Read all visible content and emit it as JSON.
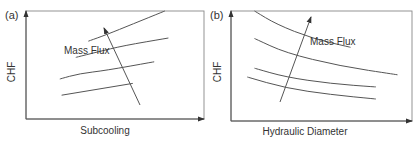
{
  "chart_data": [
    {
      "type": "line",
      "panel_label": "(a)",
      "title": "",
      "xlabel": "Subcooling",
      "ylabel": "CHF",
      "annotation": "Mass Flux",
      "annotation_meaning": "arrow indicates increasing mass flux",
      "trend": "CHF increases with subcooling; curves shift upward with increasing mass flux",
      "xlim": [
        0,
        1
      ],
      "ylim": [
        0,
        1
      ],
      "series": [
        {
          "name": "low mass flux",
          "x": [
            0.2,
            0.6
          ],
          "y": [
            0.22,
            0.33
          ]
        },
        {
          "name": "mass flux 2",
          "x": [
            0.19,
            0.3,
            0.45,
            0.72
          ],
          "y": [
            0.37,
            0.42,
            0.45,
            0.53
          ]
        },
        {
          "name": "mass flux 3",
          "x": [
            0.28,
            0.4,
            0.55,
            0.8
          ],
          "y": [
            0.57,
            0.62,
            0.68,
            0.75
          ]
        },
        {
          "name": "high mass flux",
          "x": [
            0.35,
            0.45,
            0.6,
            0.78
          ],
          "y": [
            0.72,
            0.78,
            0.88,
            1.0
          ]
        }
      ]
    },
    {
      "type": "line",
      "panel_label": "(b)",
      "title": "",
      "xlabel": "Hydraulic Diameter",
      "ylabel": "CHF",
      "annotation": "Mass Flux",
      "annotation_meaning": "arrow indicates increasing mass flux",
      "trend": "CHF decreases with hydraulic diameter; curves shift upward with increasing mass flux",
      "xlim": [
        0,
        1
      ],
      "ylim": [
        0,
        1
      ],
      "series": [
        {
          "name": "low mass flux",
          "x": [
            0.09,
            0.3,
            0.55,
            0.8
          ],
          "y": [
            0.4,
            0.3,
            0.24,
            0.2
          ]
        },
        {
          "name": "mass flux 2",
          "x": [
            0.13,
            0.3,
            0.55,
            0.8
          ],
          "y": [
            0.48,
            0.4,
            0.34,
            0.31
          ]
        },
        {
          "name": "mass flux 3",
          "x": [
            0.13,
            0.3,
            0.6,
            0.92
          ],
          "y": [
            0.75,
            0.62,
            0.5,
            0.42
          ]
        },
        {
          "name": "high mass flux",
          "x": [
            0.13,
            0.25,
            0.45,
            0.66
          ],
          "y": [
            1.0,
            0.88,
            0.75,
            0.67
          ]
        }
      ]
    }
  ]
}
